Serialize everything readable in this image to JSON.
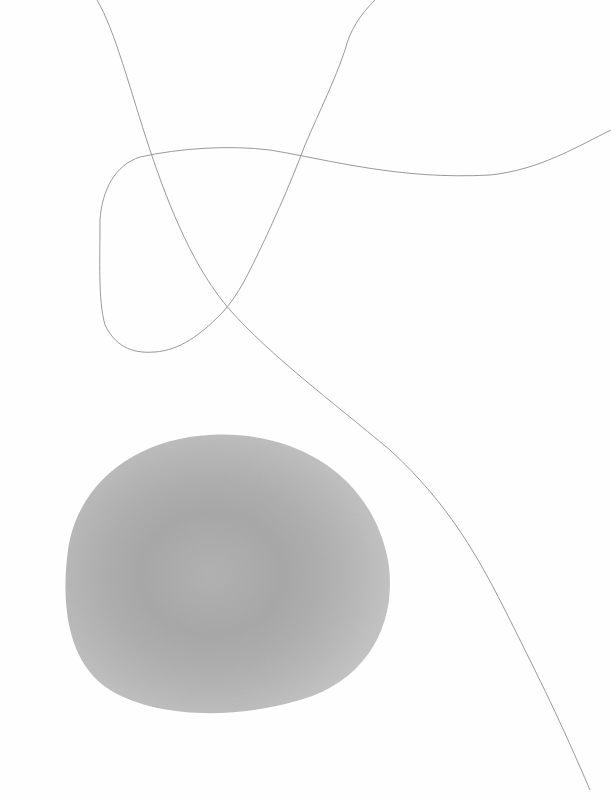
{
  "artwork": {
    "background": "#fefefe",
    "line_color": "#9a9a9a",
    "wash": {
      "shape": "circle",
      "cx": 230,
      "cy": 568,
      "rx": 162,
      "ry": 136,
      "outer_color": "#b9b9b9",
      "inner_color": "#a8a8a8"
    },
    "lines": [
      "long-curve-top-left-to-bottom-right",
      "loop-curve-top-center-to-right-edge"
    ]
  }
}
